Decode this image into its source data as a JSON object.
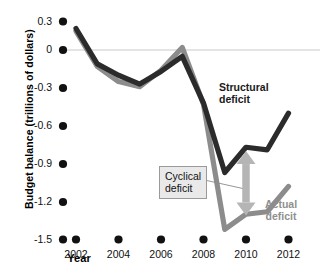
{
  "chart_data": {
    "type": "line",
    "title": "",
    "xlabel": "Year",
    "ylabel": "Budget balance (trillions of dollars)",
    "xlim": [
      2001.7,
      2012.3
    ],
    "ylim": [
      -1.5,
      0.3
    ],
    "xticks": [
      "2002",
      "2004",
      "2006",
      "2008",
      "2010",
      "2012"
    ],
    "xtick_values": [
      2002,
      2004,
      2006,
      2008,
      2010,
      2012
    ],
    "yticks": [
      "0.3",
      "0",
      "-0.3",
      "-0.6",
      "-0.9",
      "-1.2",
      "-1.5"
    ],
    "ytick_values": [
      0.3,
      0,
      -0.3,
      -0.6,
      -0.9,
      -1.2,
      -1.5
    ],
    "grid": false,
    "zero_line": true,
    "legend_position": "inline-annotations",
    "x": [
      2002,
      2003,
      2004,
      2005,
      2006,
      2007,
      2008,
      2009,
      2010,
      2011,
      2012
    ],
    "series": [
      {
        "name": "Structural deficit",
        "color": "#2b2b2b",
        "values": [
          0.17,
          -0.11,
          -0.2,
          -0.27,
          -0.17,
          -0.05,
          -0.42,
          -0.97,
          -0.77,
          -0.79,
          -0.5
        ]
      },
      {
        "name": "Actual deficit",
        "color": "#8c8c8c",
        "values": [
          0.15,
          -0.13,
          -0.25,
          -0.29,
          -0.16,
          0.02,
          -0.43,
          -1.42,
          -1.3,
          -1.28,
          -1.08
        ]
      }
    ],
    "annotations": [
      {
        "name": "structural-deficit-label",
        "text_line1": "Structural",
        "text_line2": "deficit",
        "color": "#1a1a1a"
      },
      {
        "name": "actual-deficit-label",
        "text_line1": "Actual",
        "text_line2": "deficit",
        "color": "#8f8f8f"
      },
      {
        "name": "cyclical-deficit-callout",
        "text_line1": "Cyclical",
        "text_line2": "deficit",
        "color": "#111111",
        "arrow": {
          "x_value": 2010,
          "y_top": -0.8,
          "y_bottom": -1.31,
          "color": "#b5b5b5"
        }
      }
    ]
  },
  "axes": {
    "x_title": "Year",
    "y_title": "Budget balance (trillions of dollars)"
  }
}
